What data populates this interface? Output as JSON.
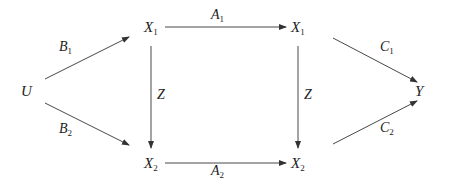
{
  "diagram": {
    "type": "commutative-diagram",
    "nodes": [
      {
        "id": "U",
        "base": "U",
        "sub": "",
        "x": 22,
        "y": 84
      },
      {
        "id": "X1L",
        "base": "X",
        "sub": "1",
        "x": 144,
        "y": 20
      },
      {
        "id": "X2L",
        "base": "X",
        "sub": "2",
        "x": 144,
        "y": 156
      },
      {
        "id": "X1R",
        "base": "X",
        "sub": "1",
        "x": 291,
        "y": 20
      },
      {
        "id": "X2R",
        "base": "X",
        "sub": "2",
        "x": 291,
        "y": 156
      },
      {
        "id": "Y",
        "base": "Y",
        "sub": "",
        "x": 414,
        "y": 84
      }
    ],
    "edges": [
      {
        "from": "U",
        "to": "X1L",
        "label": {
          "base": "B",
          "sub": "1"
        }
      },
      {
        "from": "U",
        "to": "X2L",
        "label": {
          "base": "B",
          "sub": "2"
        }
      },
      {
        "from": "X1L",
        "to": "X1R",
        "label": {
          "base": "A",
          "sub": "1"
        }
      },
      {
        "from": "X2L",
        "to": "X2R",
        "label": {
          "base": "A",
          "sub": "2"
        }
      },
      {
        "from": "X1L",
        "to": "X2L",
        "label": {
          "base": "Z",
          "sub": ""
        }
      },
      {
        "from": "X1R",
        "to": "X2R",
        "label": {
          "base": "Z",
          "sub": ""
        }
      },
      {
        "from": "X1R",
        "to": "Y",
        "label": {
          "base": "C",
          "sub": "1"
        }
      },
      {
        "from": "X2R",
        "to": "Y",
        "label": {
          "base": "C",
          "sub": "2"
        }
      }
    ]
  },
  "labels": {
    "U": "U",
    "X": "X",
    "Y": "Y",
    "Z": "Z",
    "A": "A",
    "B": "B",
    "C": "C",
    "one": "1",
    "two": "2"
  },
  "colors": {
    "stroke": "#333333",
    "text": "#222222",
    "background": "#ffffff"
  }
}
